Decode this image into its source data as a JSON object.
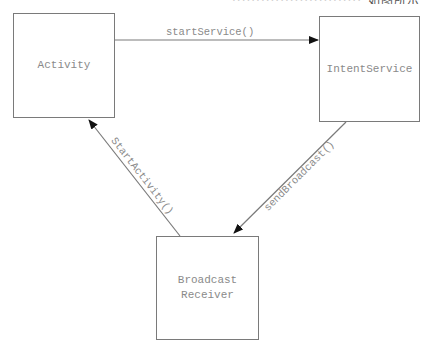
{
  "clipped_caption": {
    "light": "···························",
    "dark": "如图所示"
  },
  "nodes": [
    {
      "id": "activity",
      "label": "Activity"
    },
    {
      "id": "intent_service",
      "label": "IntentService"
    },
    {
      "id": "broadcast_receiver",
      "label": "Broadcast\nReceiver"
    }
  ],
  "edges": [
    {
      "from": "activity",
      "to": "intent_service",
      "label": "startService()"
    },
    {
      "from": "intent_service",
      "to": "broadcast_receiver",
      "label": "sendBroadcast()"
    },
    {
      "from": "broadcast_receiver",
      "to": "activity",
      "label": "StartActivity()"
    }
  ],
  "colors": {
    "stroke": "#7a7a7a",
    "arrowhead": "#111111",
    "text": "#8a8a8a",
    "background": "#ffffff"
  }
}
